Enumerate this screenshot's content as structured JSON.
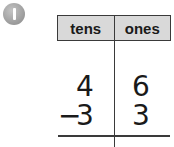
{
  "problem": {
    "number": "1",
    "badge_color": "#9a9a9a"
  },
  "table": {
    "headers": [
      "tens",
      "ones"
    ],
    "header_bg": "#d9d9d9",
    "rows": [
      {
        "operator": "",
        "tens": "4",
        "ones": "6"
      },
      {
        "operator": "−",
        "tens": "3",
        "ones": "3"
      }
    ]
  }
}
